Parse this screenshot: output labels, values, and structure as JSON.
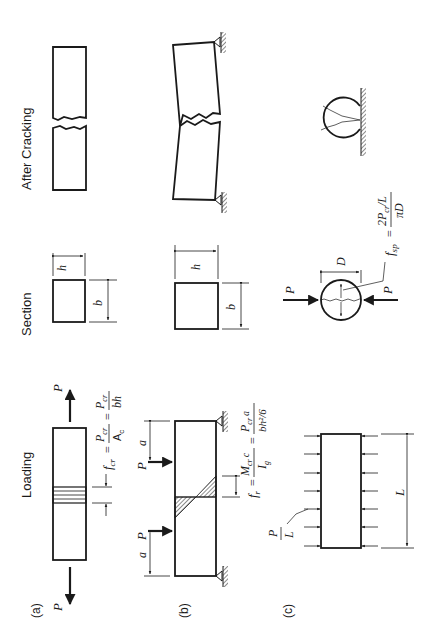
{
  "figure": {
    "orientation": "rotated-90-ccw",
    "column_headers": {
      "loading": "Loading",
      "section": "Section",
      "after_cracking": "After Cracking"
    },
    "rows": [
      {
        "id": "a",
        "label": "(a)",
        "test": "direct tension",
        "load_symbol": "P",
        "section_dims": {
          "width": "b",
          "height": "h"
        },
        "equation": {
          "lhs": "f",
          "lhs_sub": "cr",
          "eq": "=",
          "frac1_num": "P",
          "frac1_num_sub": "cr",
          "frac1_den": "A",
          "frac1_den_sub": "c",
          "eq2": "=",
          "frac2_num": "P",
          "frac2_num_sub": "cr",
          "frac2_den": "bh"
        }
      },
      {
        "id": "b",
        "label": "(b)",
        "test": "flexural (third-point) test",
        "load_symbol": "P",
        "span_symbol": "a",
        "section_dims": {
          "width": "b",
          "height": "h"
        },
        "equation": {
          "lhs": "f",
          "lhs_sub": "r",
          "eq": "=",
          "frac1_num": "M",
          "frac1_num_sub": "cr",
          "frac1_num_tail": "c",
          "frac1_den": "I",
          "frac1_den_sub": "g",
          "eq2": "=",
          "frac2_num": "P",
          "frac2_num_sub": "cr",
          "frac2_num_tail": "a",
          "frac2_den": "bh²/6"
        }
      },
      {
        "id": "c",
        "label": "(c)",
        "test": "split cylinder test",
        "load_symbol": "P",
        "distributed_load": {
          "num": "P",
          "den": "L"
        },
        "length_symbol": "L",
        "diameter_symbol": "D",
        "equation": {
          "lhs": "f",
          "lhs_sub": "sp",
          "eq": "=",
          "frac_num": "2P",
          "frac_num_sub": "cr",
          "frac_num_tail": "/L",
          "frac_den": "πD"
        }
      }
    ],
    "colors": {
      "ink": "#1a1a1a",
      "background": "#ffffff"
    }
  }
}
